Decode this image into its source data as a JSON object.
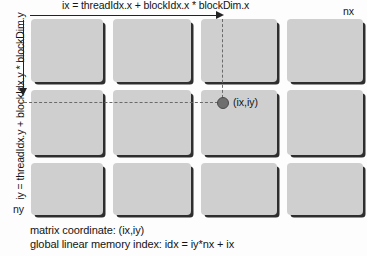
{
  "figure": {
    "title_formula": "ix = threadIdx.x + blockIdx.x * blockDim.x",
    "side_formula": "iy = threadIdx.y + blockIdx.y * blockDim.y",
    "x_axis_end_label": "nx",
    "y_axis_end_label": "ny",
    "point_label": "(ix,iy)",
    "caption_line1": "matrix coordinate: (ix,iy)",
    "caption_line2": "global linear memory index: idx = iy*nx + ix",
    "colors": {
      "block_fill": "#cfcfcf",
      "block_shadow": "#2e2e2e",
      "arrow": "#232323",
      "dashed_guide": "#6a6a6a",
      "point": "#6e6e6e",
      "text": "#141414",
      "background": "#fdfdfd"
    },
    "grid": {
      "columns": 4,
      "rows": 3,
      "cells": [
        {
          "name": "block-r0c0",
          "x": 0,
          "y": 0,
          "w": 72,
          "h": 63
        },
        {
          "name": "block-r0c1",
          "x": 82,
          "y": 0,
          "w": 78,
          "h": 63
        },
        {
          "name": "block-r0c2",
          "x": 170,
          "y": 0,
          "w": 76,
          "h": 63
        },
        {
          "name": "block-r0c3",
          "x": 256,
          "y": 0,
          "w": 76,
          "h": 63
        },
        {
          "name": "block-r1c0",
          "x": 0,
          "y": 71,
          "w": 72,
          "h": 65
        },
        {
          "name": "block-r1c1",
          "x": 82,
          "y": 71,
          "w": 78,
          "h": 65
        },
        {
          "name": "block-r1c2",
          "x": 170,
          "y": 71,
          "w": 76,
          "h": 65
        },
        {
          "name": "block-r1c3",
          "x": 256,
          "y": 71,
          "w": 76,
          "h": 65
        },
        {
          "name": "block-r2c0",
          "x": 0,
          "y": 144,
          "w": 72,
          "h": 52
        },
        {
          "name": "block-r2c1",
          "x": 82,
          "y": 144,
          "w": 78,
          "h": 52
        },
        {
          "name": "block-r2c2",
          "x": 170,
          "y": 144,
          "w": 76,
          "h": 52
        },
        {
          "name": "block-r2c3",
          "x": 256,
          "y": 144,
          "w": 76,
          "h": 52
        }
      ]
    }
  }
}
